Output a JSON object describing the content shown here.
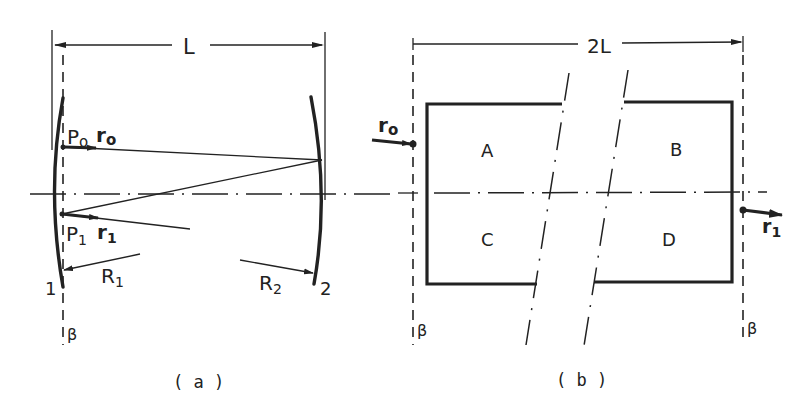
{
  "diagram": {
    "panel_a": {
      "caption": "( a )",
      "dimension_label": "L",
      "mirror_1_label": "1",
      "mirror_2_label": "2",
      "point_p0_label": "P",
      "point_p0_sub": "o",
      "point_p1_label": "P",
      "point_p1_sub": "1",
      "ray_r0_label": "r",
      "ray_r0_sub": "o",
      "ray_r1_label": "r",
      "ray_r1_sub": "1",
      "radius_1_label": "R",
      "radius_1_sub": "1",
      "radius_2_label": "R",
      "radius_2_sub": "2",
      "reference_plane_label": "β"
    },
    "panel_b": {
      "caption": "( b )",
      "dimension_label": "2L",
      "region_labels": [
        "A",
        "B",
        "C",
        "D"
      ],
      "input_ray_label": "r",
      "input_ray_sub": "o",
      "output_ray_label": "r",
      "output_ray_sub": "1",
      "left_plane_label": "β",
      "right_plane_label": "β"
    }
  }
}
